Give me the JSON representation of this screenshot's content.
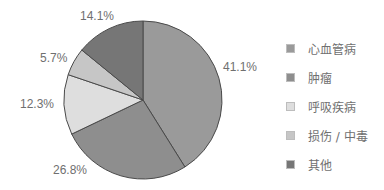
{
  "chart_data": {
    "type": "pie",
    "title": "",
    "start_angle_deg": 0,
    "direction": "clockwise",
    "center": [
      143,
      100
    ],
    "radius": 79,
    "slices": [
      {
        "label": "心血管病",
        "value": 41.1,
        "display": "41.1%",
        "color": "#9a9a9a",
        "label_pos": [
          223,
          60
        ]
      },
      {
        "label": "肿瘤",
        "value": 26.8,
        "display": "26.8%",
        "color": "#8e8e8e",
        "label_pos": [
          53,
          163
        ]
      },
      {
        "label": "呼吸疾病",
        "value": 12.3,
        "display": "12.3%",
        "color": "#dedede",
        "label_pos": [
          20,
          97
        ]
      },
      {
        "label": "损伤 / 中毒",
        "value": 5.7,
        "display": "5.7%",
        "color": "#c6c6c6",
        "label_pos": [
          40,
          51
        ]
      },
      {
        "label": "其他",
        "value": 14.1,
        "display": "14.1%",
        "color": "#767676",
        "label_pos": [
          80,
          9
        ]
      }
    ],
    "legend": {
      "position": "right",
      "entries": [
        "心血管病",
        "肿瘤",
        "呼吸疾病",
        "损伤 / 中毒",
        "其他"
      ]
    }
  }
}
